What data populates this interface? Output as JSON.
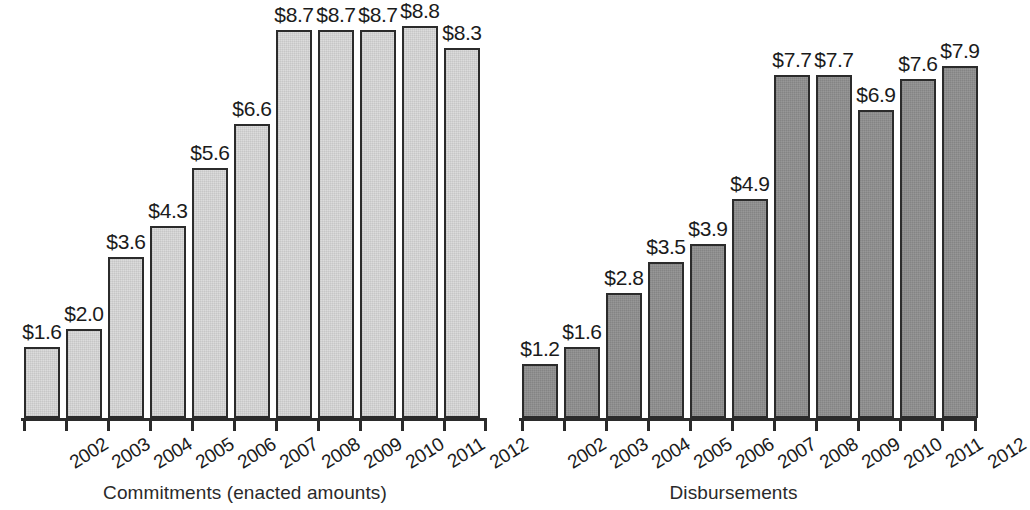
{
  "chart_data": [
    {
      "type": "bar",
      "title": "",
      "caption": "Commitments (enacted amounts)",
      "xlabel": "",
      "ylabel": "",
      "ylim": [
        0,
        9.2
      ],
      "grid": false,
      "legend": "none",
      "bar_color": "#dcdcdc",
      "bar_border_color": "#2b2b2b",
      "value_prefix": "$",
      "categories": [
        "2002",
        "2003",
        "2004",
        "2005",
        "2006",
        "2007",
        "2008",
        "2009",
        "2010",
        "2011",
        "2012"
      ],
      "values": [
        1.6,
        2.0,
        3.6,
        4.3,
        5.6,
        6.6,
        8.7,
        8.7,
        8.7,
        8.8,
        8.3
      ],
      "labels": [
        "$1.6",
        "$2.0",
        "$3.6",
        "$4.3",
        "$5.6",
        "$6.6",
        "$8.7",
        "$8.7",
        "$8.7",
        "$8.8",
        "$8.3"
      ]
    },
    {
      "type": "bar",
      "title": "",
      "caption": "Disbursements",
      "xlabel": "",
      "ylabel": "",
      "ylim": [
        0,
        9.2
      ],
      "grid": false,
      "legend": "none",
      "bar_color": "#8e8e8e",
      "bar_border_color": "#2b2b2b",
      "value_prefix": "$",
      "categories": [
        "2002",
        "2003",
        "2004",
        "2005",
        "2006",
        "2007",
        "2008",
        "2009",
        "2010",
        "2011",
        "2012"
      ],
      "values": [
        1.2,
        1.6,
        2.8,
        3.5,
        3.9,
        4.9,
        7.7,
        7.7,
        6.9,
        7.6,
        7.9
      ],
      "labels": [
        "$1.2",
        "$1.6",
        "$2.8",
        "$3.5",
        "$3.9",
        "$4.9",
        "$7.7",
        "$7.7",
        "$6.9",
        "$7.6",
        "$7.9"
      ]
    }
  ],
  "panels": {
    "left": {
      "caption": "Commitments (enacted amounts)"
    },
    "right": {
      "caption": "Disbursements"
    }
  }
}
